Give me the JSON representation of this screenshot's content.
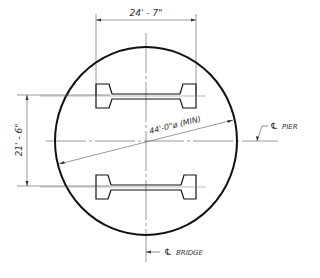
{
  "drawing": {
    "type": "pier-plan-section",
    "colors": {
      "line": "#111111",
      "thin_line": "#444444",
      "text": "#333333",
      "background": "#ffffff"
    },
    "dimensions": {
      "beam_spacing_width": "24' - 7\"",
      "beam_spacing_height": "21' - 6\"",
      "diameter": "44'-0\"ø (MIN)"
    },
    "labels": {
      "pier_centerline_symbol": "℄",
      "pier_centerline_text": "PIER",
      "bridge_centerline_symbol": "℄",
      "bridge_centerline_text": "BRIDGE"
    },
    "elements": {
      "circle": {
        "cx": 146,
        "cy": 141,
        "rx": 91,
        "ry": 94
      },
      "beams": [
        {
          "name": "upper-girder",
          "y_top": 84,
          "y_bottom": 108
        },
        {
          "name": "lower-girder",
          "y_top": 174,
          "y_bottom": 199
        }
      ]
    }
  }
}
